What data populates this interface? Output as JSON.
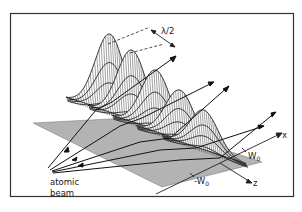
{
  "figure": {
    "type": "3d-mesh-surface-diagram",
    "frame": {
      "x": 10,
      "y": 13,
      "width": 284,
      "height": 184,
      "stroke": "#333333"
    },
    "num_peaks": 5,
    "colors": {
      "ink": "#222222",
      "paper": "#ffffff",
      "frame": "#333333"
    }
  },
  "labels": {
    "wavelength": "λ/2",
    "atomic_beam_line1": "atomic",
    "atomic_beam_line2": "beam",
    "x_axis": "x",
    "z_axis": "z",
    "w0_pos": "W",
    "w0_pos_sub": "0",
    "w0_neg": "-W",
    "w0_neg_sub": "0"
  }
}
